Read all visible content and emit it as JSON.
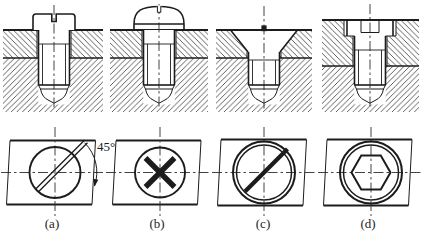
{
  "figure": {
    "type": "technical-drawing",
    "columns": [
      {
        "label": "(a)",
        "head_type": "slotted-cheese-head"
      },
      {
        "label": "(b)",
        "head_type": "cross-recessed-round-head"
      },
      {
        "label": "(c)",
        "head_type": "slotted-countersunk-head"
      },
      {
        "label": "(d)",
        "head_type": "hex-socket-cap-head"
      }
    ],
    "annotation": {
      "angle": "45°"
    }
  },
  "colors": {
    "ink": "#1c1c1c",
    "paper": "#ffffff"
  }
}
